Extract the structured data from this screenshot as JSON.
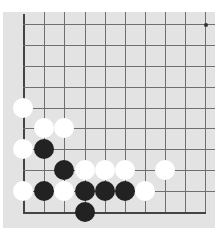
{
  "board": {
    "background": "#e3e3e3",
    "line_color": "#6f6f6f",
    "columns_x": [
      23,
      44,
      64,
      85,
      105,
      125,
      145,
      165,
      185,
      205
    ],
    "rows_y": [
      24,
      45,
      66,
      87,
      108,
      128,
      149,
      170,
      191,
      212
    ],
    "edges": [
      "left",
      "bottom"
    ],
    "star_points": [
      {
        "col": 9,
        "row": 0
      }
    ],
    "stones": [
      {
        "color": "white",
        "col": 0,
        "row": 4
      },
      {
        "color": "white",
        "col": 1,
        "row": 5
      },
      {
        "color": "white",
        "col": 2,
        "row": 5
      },
      {
        "color": "white",
        "col": 0,
        "row": 6
      },
      {
        "color": "black",
        "col": 1,
        "row": 6
      },
      {
        "color": "black",
        "col": 2,
        "row": 7
      },
      {
        "color": "white",
        "col": 3,
        "row": 7
      },
      {
        "color": "white",
        "col": 4,
        "row": 7
      },
      {
        "color": "white",
        "col": 5,
        "row": 7
      },
      {
        "color": "white",
        "col": 7,
        "row": 7
      },
      {
        "color": "white",
        "col": 0,
        "row": 8
      },
      {
        "color": "black",
        "col": 1,
        "row": 8
      },
      {
        "color": "white",
        "col": 2,
        "row": 8
      },
      {
        "color": "black",
        "col": 3,
        "row": 8
      },
      {
        "color": "black",
        "col": 4,
        "row": 8
      },
      {
        "color": "black",
        "col": 5,
        "row": 8
      },
      {
        "color": "white",
        "col": 6,
        "row": 8
      },
      {
        "color": "black",
        "col": 3,
        "row": 9
      }
    ]
  }
}
